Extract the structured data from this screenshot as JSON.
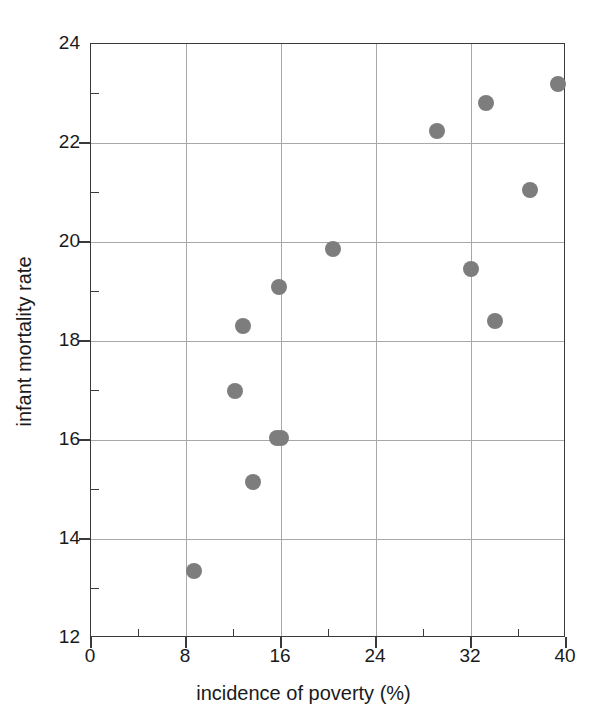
{
  "chart_data": {
    "type": "scatter",
    "title": "",
    "xlabel": "incidence of poverty (%)",
    "ylabel": "infant mortality rate",
    "xlim": [
      0,
      40
    ],
    "ylim": [
      12,
      24
    ],
    "xticks": [
      0,
      8,
      16,
      24,
      32,
      40
    ],
    "xticklabels": [
      "0",
      "8",
      "16",
      "24",
      "32",
      "40"
    ],
    "xminorticks": [
      4,
      12,
      20,
      28,
      36
    ],
    "yticks": [
      12,
      14,
      16,
      18,
      20,
      22,
      24
    ],
    "yticklabels": [
      "12",
      "14",
      "16",
      "18",
      "20",
      "22",
      "24"
    ],
    "yminorticks": [
      13,
      15,
      17,
      19,
      21,
      23
    ],
    "grid": true,
    "legend": null,
    "marker_color": "#7d7d7d",
    "grid_color": "#a8a8a8",
    "axis_color": "#3a3a3a",
    "points": [
      {
        "x": 8.7,
        "y": 13.35
      },
      {
        "x": 12.1,
        "y": 17.0
      },
      {
        "x": 12.8,
        "y": 18.3
      },
      {
        "x": 13.6,
        "y": 15.15
      },
      {
        "x": 15.7,
        "y": 16.05
      },
      {
        "x": 16.0,
        "y": 16.05
      },
      {
        "x": 15.8,
        "y": 19.1
      },
      {
        "x": 20.4,
        "y": 19.85
      },
      {
        "x": 29.1,
        "y": 22.25
      },
      {
        "x": 32.0,
        "y": 19.45
      },
      {
        "x": 33.3,
        "y": 22.8
      },
      {
        "x": 34.0,
        "y": 18.4
      },
      {
        "x": 37.0,
        "y": 21.05
      },
      {
        "x": 39.3,
        "y": 23.2
      }
    ]
  }
}
